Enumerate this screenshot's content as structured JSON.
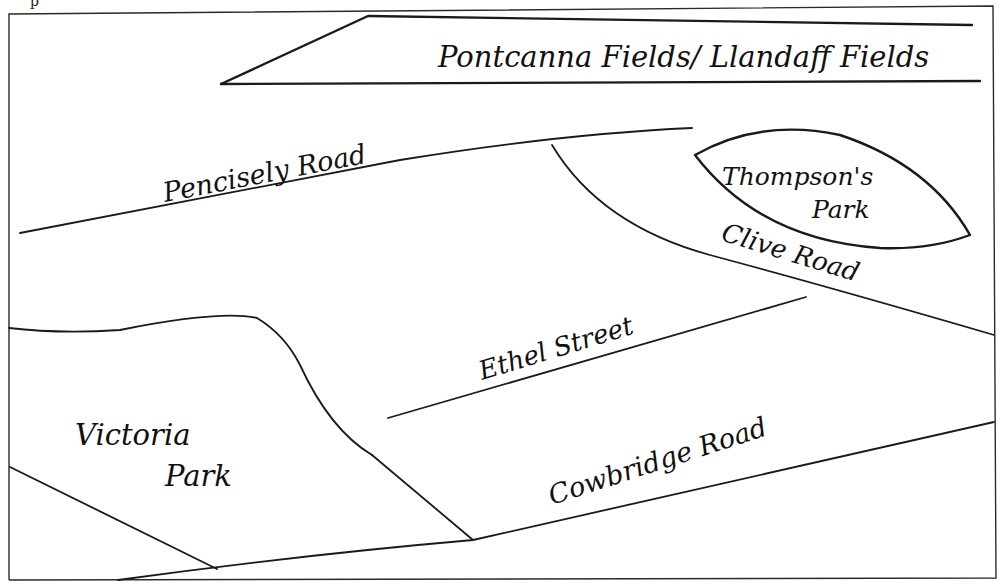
{
  "map": {
    "title_fragment": "p",
    "labels": {
      "pontcanna": "Pontcanna Fields/ Llandaff Fields",
      "pencisely": "Pencisely Road",
      "thompsons_line1": "Thompson's",
      "thompsons_line2": "Park",
      "clive": "Clive Road",
      "ethel": "Ethel Street",
      "victoria_line1": "Victoria",
      "victoria_line2": "Park",
      "cowbridge": "Cowbridge Road"
    },
    "colors": {
      "ink": "#1a1a1a",
      "paper": "#ffffff"
    },
    "features": [
      {
        "name": "Pontcanna Fields/ Llandaff Fields",
        "type": "park"
      },
      {
        "name": "Pencisely Road",
        "type": "road"
      },
      {
        "name": "Thompson's Park",
        "type": "park"
      },
      {
        "name": "Clive Road",
        "type": "road"
      },
      {
        "name": "Ethel Street",
        "type": "road"
      },
      {
        "name": "Victoria Park",
        "type": "park"
      },
      {
        "name": "Cowbridge Road",
        "type": "road"
      }
    ]
  }
}
